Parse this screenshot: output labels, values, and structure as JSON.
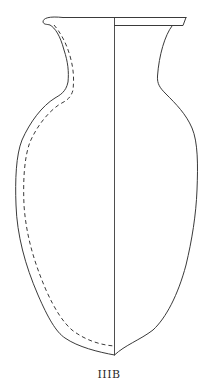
{
  "figure": {
    "type": "vessel-profile-drawing",
    "label": "IIIB",
    "parts": [
      "rim",
      "neck",
      "body",
      "base",
      "center-axis",
      "interior-profile"
    ],
    "line_color": "#3a3a3a",
    "background": "#ffffff"
  }
}
